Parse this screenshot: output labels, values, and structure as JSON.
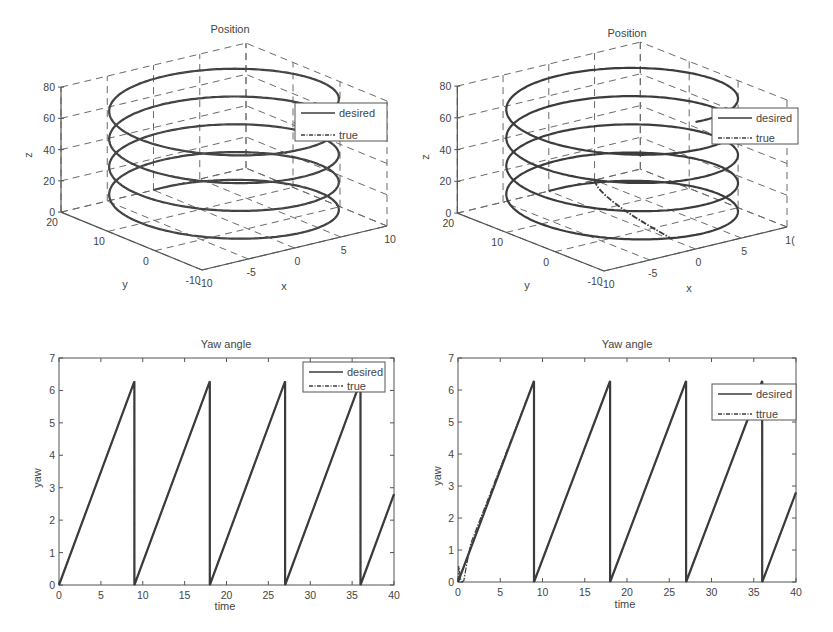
{
  "chart_data": [
    {
      "id": "position-3d-left",
      "type": "line3d",
      "title": "Position",
      "xlabel": "x",
      "ylabel": "y",
      "zlabel": "z",
      "xlim": [
        -10,
        10
      ],
      "ylim": [
        -10,
        20
      ],
      "zlim": [
        0,
        80
      ],
      "xticks": [
        -10,
        -5,
        0,
        5,
        10
      ],
      "yticks": [
        -10,
        0,
        10,
        20
      ],
      "zticks": [
        0,
        20,
        40,
        60,
        80
      ],
      "grid": true,
      "legend": {
        "position": "upper right",
        "entries": [
          "desired",
          "true"
        ]
      },
      "helix": {
        "center_x": 0,
        "center_y": 5,
        "radius": 10,
        "z_start": 0,
        "z_end": 80,
        "turns": 4.5
      },
      "series": [
        {
          "name": "desired",
          "style": "solid",
          "description": "helix, radius 10 around (0,5), z rising 0 to 80 over ~4.5 turns"
        },
        {
          "name": "true",
          "style": "dash-dot",
          "description": "tracks desired helix closely from start"
        }
      ]
    },
    {
      "id": "position-3d-right",
      "type": "line3d",
      "title": "Position",
      "xlabel": "x",
      "ylabel": "y",
      "zlabel": "z",
      "xlim": [
        -10,
        10
      ],
      "ylim": [
        -10,
        20
      ],
      "zlim": [
        0,
        80
      ],
      "xticks": [
        -10,
        -5,
        0,
        5,
        "1("
      ],
      "yticks": [
        -10,
        0,
        10,
        20
      ],
      "zticks": [
        0,
        20,
        40,
        60,
        80
      ],
      "grid": true,
      "legend": {
        "position": "upper right",
        "entries": [
          "desired",
          "true"
        ]
      },
      "helix": {
        "center_x": 0,
        "center_y": 5,
        "radius": 10,
        "z_start": 0,
        "z_end": 80,
        "turns": 4.5
      },
      "series": [
        {
          "name": "desired",
          "style": "solid",
          "description": "helix, radius 10 around (0,5), z rising 0 to 80"
        },
        {
          "name": "true",
          "style": "dash-dot",
          "description": "starts off-helix near (5,20,0) and converges onto the helix within first turn"
        }
      ],
      "true_start_point": [
        5,
        20,
        0
      ]
    },
    {
      "id": "yaw-left",
      "type": "line",
      "title": "Yaw angle",
      "xlabel": "time",
      "ylabel": "yaw",
      "xlim": [
        0,
        40
      ],
      "ylim": [
        0,
        7
      ],
      "xticks": [
        0,
        5,
        10,
        15,
        20,
        25,
        30,
        35,
        40
      ],
      "yticks": [
        0,
        1,
        2,
        3,
        4,
        5,
        6,
        7
      ],
      "grid": false,
      "legend": {
        "position": "upper right",
        "entries": [
          "desired",
          "true"
        ]
      },
      "series": [
        {
          "name": "desired",
          "style": "solid",
          "x": [
            0,
            9,
            9,
            18,
            18,
            27,
            27,
            36,
            36,
            40
          ],
          "y": [
            0,
            6.28,
            0,
            6.28,
            0,
            6.28,
            0,
            6.28,
            0,
            2.8
          ]
        },
        {
          "name": "true",
          "style": "dash-dot",
          "x": [
            0,
            9,
            9,
            18,
            18,
            27,
            27,
            36,
            36,
            40
          ],
          "y": [
            0,
            6.28,
            0,
            6.28,
            0,
            6.28,
            0,
            6.28,
            0,
            2.8
          ]
        }
      ]
    },
    {
      "id": "yaw-right",
      "type": "line",
      "title": "Yaw angle",
      "xlabel": "time",
      "ylabel": "yaw",
      "xlim": [
        0,
        40
      ],
      "ylim": [
        0,
        7
      ],
      "xticks": [
        0,
        5,
        10,
        15,
        20,
        25,
        30,
        35,
        40
      ],
      "yticks": [
        0,
        1,
        2,
        3,
        4,
        5,
        6,
        7
      ],
      "grid": false,
      "legend": {
        "position": "upper right",
        "entries": [
          "desired",
          "ttrue"
        ]
      },
      "series": [
        {
          "name": "desired",
          "style": "solid",
          "x": [
            0,
            9,
            9,
            18,
            18,
            27,
            27,
            36,
            36,
            40
          ],
          "y": [
            0,
            6.28,
            0,
            6.28,
            0,
            6.28,
            0,
            6.28,
            0,
            2.8
          ]
        },
        {
          "name": "ttrue",
          "style": "dash-dot",
          "x": [
            0,
            0.1,
            0.3,
            0.5,
            0.7,
            1.0,
            1.5,
            9,
            9,
            18,
            18,
            27,
            27,
            36,
            36,
            40
          ],
          "y": [
            0,
            0.5,
            0.1,
            0.0,
            0.05,
            0.5,
            1.2,
            6.28,
            0,
            6.28,
            0,
            6.28,
            0,
            6.28,
            0,
            2.8
          ]
        }
      ]
    }
  ],
  "layout": {
    "panels": [
      {
        "chart": 0,
        "proj": {
          "ox": 202,
          "oy": 270,
          "xx": 9.25,
          "xy": -2.2,
          "yx": -4.7,
          "yy": -1.93,
          "zz": -1.5625
        },
        "legend_box": [
          295,
          103,
          92,
          38
        ],
        "title_pos": [
          230,
          33
        ],
        "zlabel_pos": [
          32,
          155
        ],
        "xlabel_pos": [
          284,
          290
        ],
        "ylabel_pos": [
          125,
          288
        ]
      },
      {
        "chart": 1,
        "proj": {
          "ox": 604,
          "oy": 271,
          "xx": 9.15,
          "xy": -2.2,
          "yx": -4.89,
          "yy": -1.93,
          "zz": -1.5875
        },
        "legend_box": [
          712,
          108,
          86,
          36
        ],
        "title_pos": [
          627,
          37
        ],
        "zlabel_pos": [
          429,
          157
        ],
        "xlabel_pos": [
          689,
          292
        ],
        "ylabel_pos": [
          527,
          289
        ]
      },
      {
        "chart": 2,
        "axes": [
          59,
          358,
          394,
          585
        ],
        "legend_box": [
          303,
          362,
          82,
          30
        ],
        "title_pos": [
          226,
          348
        ],
        "xlabel_pos": [
          225,
          610
        ],
        "ylabel_pos": [
          41,
          478
        ]
      },
      {
        "chart": 3,
        "axes": [
          458,
          358,
          796,
          582
        ],
        "legend_box": [
          712,
          384,
          84,
          36
        ],
        "title_pos": [
          627,
          348
        ],
        "xlabel_pos": [
          625,
          608
        ],
        "ylabel_pos": [
          441,
          476
        ]
      }
    ],
    "colors": {
      "line": "#3c3c3c",
      "axis": "#555555",
      "grid": "#6a6a6a",
      "text": "#444444",
      "background": "#ffffff"
    }
  }
}
